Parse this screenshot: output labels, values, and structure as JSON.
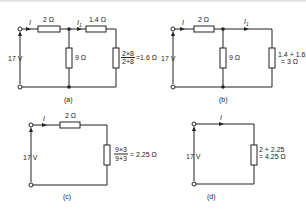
{
  "figure": {
    "panels": [
      {
        "id": "a",
        "caption": "(a)",
        "source": "17 V",
        "current_main": "I",
        "current_branch": "I",
        "current_branch_sub": "1",
        "series_resistor": "2 Ω",
        "branch_series_resistor": "1.4 Ω",
        "shunt_resistor": "9 Ω",
        "load_num": "2×8",
        "load_den": "2+8",
        "load_result": "=1.6 Ω"
      },
      {
        "id": "b",
        "caption": "(b)",
        "source": "17 V",
        "current_main": "I",
        "current_branch": "I",
        "current_branch_sub": "1",
        "series_resistor": "2 Ω",
        "shunt_resistor": "9 Ω",
        "load_line1": "1.4 + 1.6",
        "load_line2": "= 3 Ω"
      },
      {
        "id": "c",
        "caption": "(c)",
        "source": "17 V",
        "current_main": "I",
        "series_resistor": "2 Ω",
        "load_num": "9×3",
        "load_den": "9+3",
        "load_result": "= 2.25 Ω"
      },
      {
        "id": "d",
        "caption": "(d)",
        "source": "17 V",
        "current_main": "I",
        "load_line1": "2 + 2.25",
        "load_line2": "= 4.25 Ω"
      }
    ]
  }
}
